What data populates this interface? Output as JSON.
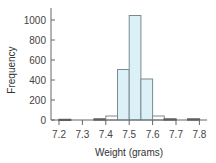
{
  "chart_data": {
    "type": "bar",
    "title": "",
    "xlabel": "Weight (grams)",
    "ylabel": "Frequency",
    "xlim": [
      7.17,
      7.83
    ],
    "ylim": [
      0,
      1150
    ],
    "grid": false,
    "legend": null,
    "x_ticks": [
      "7.2",
      "7.3",
      "7.4",
      "7.5",
      "7.6",
      "7.7",
      "7.8"
    ],
    "y_ticks": [
      "0",
      "200",
      "400",
      "600",
      "800",
      "1000"
    ],
    "bin_width": 0.05,
    "bins": [
      {
        "start": 7.2,
        "end": 7.25,
        "count": 5
      },
      {
        "start": 7.25,
        "end": 7.3,
        "count": 0
      },
      {
        "start": 7.3,
        "end": 7.35,
        "count": 0
      },
      {
        "start": 7.35,
        "end": 7.4,
        "count": 10
      },
      {
        "start": 7.4,
        "end": 7.45,
        "count": 40
      },
      {
        "start": 7.45,
        "end": 7.5,
        "count": 505
      },
      {
        "start": 7.5,
        "end": 7.55,
        "count": 1045
      },
      {
        "start": 7.55,
        "end": 7.6,
        "count": 410
      },
      {
        "start": 7.6,
        "end": 7.65,
        "count": 40
      },
      {
        "start": 7.65,
        "end": 7.7,
        "count": 10
      },
      {
        "start": 7.7,
        "end": 7.75,
        "count": 0
      },
      {
        "start": 7.75,
        "end": 7.8,
        "count": 10
      }
    ],
    "colors": {
      "bar_fill": "#dcf0f8",
      "bar_stroke": "#7a8a90",
      "axis": "#666666"
    }
  }
}
